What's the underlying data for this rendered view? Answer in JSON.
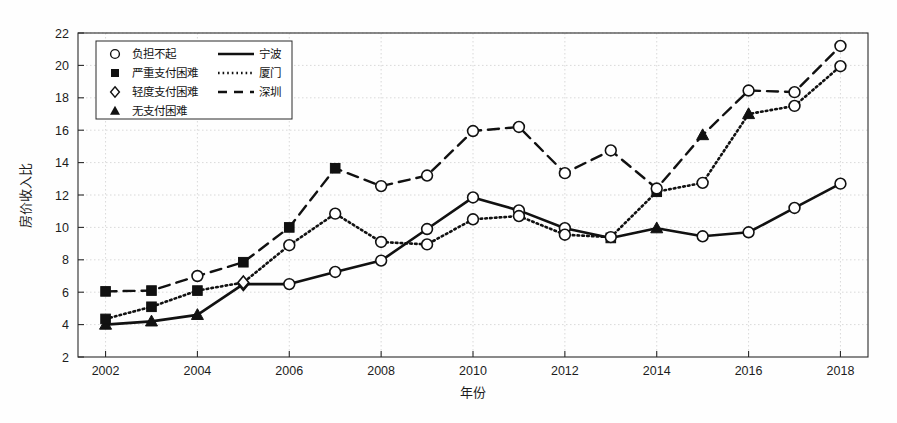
{
  "chart_data": {
    "type": "line",
    "title": "",
    "xlabel": "年份",
    "ylabel": "房价收入比",
    "x": [
      2002,
      2003,
      2004,
      2005,
      2006,
      2007,
      2008,
      2009,
      2010,
      2011,
      2012,
      2013,
      2014,
      2015,
      2016,
      2017,
      2018
    ],
    "xlim": [
      2001.4,
      2018.6
    ],
    "ylim": [
      2,
      22
    ],
    "xticks": [
      2002,
      2004,
      2006,
      2008,
      2010,
      2012,
      2014,
      2016,
      2018
    ],
    "yticks": [
      2,
      4,
      6,
      8,
      10,
      12,
      14,
      16,
      18,
      20,
      22
    ],
    "grid": true,
    "legend_position": "upper-left",
    "series": [
      {
        "name": "宁波",
        "style": "solid",
        "values": [
          4.0,
          4.2,
          4.6,
          6.5,
          6.5,
          7.25,
          7.95,
          9.9,
          11.85,
          11.05,
          9.95,
          9.35,
          9.95,
          9.45,
          9.7,
          11.2,
          12.7
        ],
        "markers": [
          "无支付困难",
          "无支付困难",
          "无支付困难",
          "轻度支付困难",
          "负担不起",
          "负担不起",
          "负担不起",
          "负担不起",
          "负担不起",
          "负担不起",
          "负担不起",
          "严重支付困难",
          "无支付困难",
          "负担不起",
          "负担不起",
          "负担不起",
          "负担不起"
        ]
      },
      {
        "name": "厦门",
        "style": "dotted",
        "values": [
          4.35,
          5.1,
          6.1,
          6.6,
          8.9,
          10.85,
          9.1,
          8.95,
          10.5,
          10.7,
          9.55,
          9.4,
          12.2,
          12.75,
          17.0,
          17.5,
          19.95
        ],
        "markers": [
          "严重支付困难",
          "严重支付困难",
          "严重支付困难",
          "轻度支付困难",
          "负担不起",
          "负担不起",
          "负担不起",
          "负担不起",
          "负担不起",
          "负担不起",
          "负担不起",
          "负担不起",
          "严重支付困难",
          "负担不起",
          "无支付困难",
          "负担不起",
          "负担不起"
        ]
      },
      {
        "name": "深圳",
        "style": "dashed",
        "values": [
          6.05,
          6.1,
          7.0,
          7.85,
          10.0,
          13.65,
          12.55,
          13.2,
          15.95,
          16.2,
          13.35,
          14.75,
          12.4,
          15.7,
          18.45,
          18.35,
          21.2
        ],
        "markers": [
          "严重支付困难",
          "严重支付困难",
          "负担不起",
          "严重支付困难",
          "严重支付困难",
          "严重支付困难",
          "负担不起",
          "负担不起",
          "负担不起",
          "负担不起",
          "负担不起",
          "负担不起",
          "负担不起",
          "无支付困难",
          "负担不起",
          "负担不起",
          "负担不起"
        ]
      }
    ]
  },
  "legend": {
    "marker_entries": [
      {
        "label": "负担不起",
        "marker": "circle"
      },
      {
        "label": "严重支付困难",
        "marker": "square"
      },
      {
        "label": "轻度支付困难",
        "marker": "diamond"
      },
      {
        "label": "无支付困难",
        "marker": "triangle"
      }
    ],
    "line_entries": [
      {
        "label": "宁波",
        "style": "solid"
      },
      {
        "label": "厦门",
        "style": "dotted"
      },
      {
        "label": "深圳",
        "style": "dashed"
      }
    ]
  },
  "colors": {
    "line": "#111111",
    "grid": "#cfcfcf",
    "axis": "#2a2a2a",
    "marker_fill_open": "#ffffff",
    "marker_fill_solid": "#111111",
    "background": "#fefefe"
  }
}
